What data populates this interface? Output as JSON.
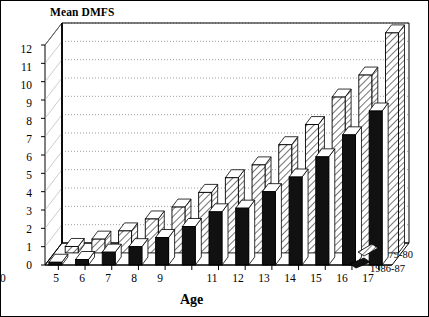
{
  "chart_data": {
    "type": "bar",
    "title": "",
    "ylabel": "Mean DMFS",
    "xlabel": "Age",
    "categories": [
      "5",
      "6",
      "7",
      "8",
      "9",
      "10",
      "11",
      "12",
      "13",
      "14",
      "15",
      "16",
      "17"
    ],
    "ylim": [
      0,
      12
    ],
    "yticks": [
      "0",
      "1",
      "2",
      "3",
      "4",
      "5",
      "6",
      "7",
      "8",
      "9",
      "10",
      "11",
      "12"
    ],
    "grid": true,
    "legend_position": "right-bottom",
    "projection": "3d-bar",
    "series": [
      {
        "name": "1979-80",
        "style": "hatched",
        "values": [
          0.35,
          0.75,
          1.2,
          1.85,
          2.5,
          3.3,
          4.1,
          4.8,
          5.9,
          7.0,
          8.5,
          9.7,
          12.0
        ]
      },
      {
        "name": "1986-87",
        "style": "solid-black",
        "values": [
          0.15,
          0.3,
          0.7,
          1.0,
          1.5,
          2.1,
          2.9,
          3.1,
          4.0,
          4.8,
          5.9,
          7.1,
          8.4
        ]
      }
    ]
  },
  "legend": {
    "entries": [
      {
        "label": "1979-80"
      },
      {
        "label": "1986-87"
      }
    ]
  },
  "axes": {
    "y_axis_title": "Mean DMFS",
    "x_axis_title": "Age"
  }
}
